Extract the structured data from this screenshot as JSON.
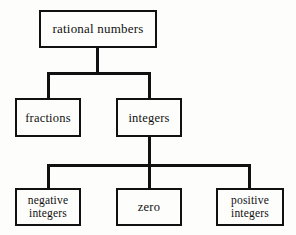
{
  "diagram": {
    "type": "hierarchy-tree",
    "colors": {
      "line": "#111111",
      "box_border": "#111111",
      "box_fill": "#fdfdfc",
      "background": "#fdfdfc",
      "text": "#111111"
    },
    "nodes": [
      {
        "id": "root",
        "label": "rational numbers",
        "level": 0
      },
      {
        "id": "fractions",
        "label": "fractions",
        "level": 1
      },
      {
        "id": "integers",
        "label": "integers",
        "level": 1
      },
      {
        "id": "negative",
        "label": "negative\ninteriors",
        "level": 2
      },
      {
        "id": "zero",
        "label": "zero",
        "level": 2
      },
      {
        "id": "positive",
        "label": "positive\ninteriors",
        "level": 2
      }
    ],
    "labels": {
      "root": "rational numbers",
      "fractions": "fractions",
      "integers": "integers",
      "negative": "negative\nintegers",
      "zero": "zero",
      "positive": "positive\nintegers"
    },
    "edges": [
      {
        "from": "root",
        "to": "fractions"
      },
      {
        "from": "root",
        "to": "integers"
      },
      {
        "from": "integers",
        "to": "negative"
      },
      {
        "from": "integers",
        "to": "zero"
      },
      {
        "from": "integers",
        "to": "positive"
      }
    ]
  }
}
